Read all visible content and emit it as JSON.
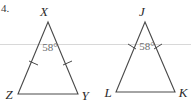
{
  "figure": {
    "problem_label": "4.",
    "background_color": "#ffffff",
    "line_color": "#4a4a4a",
    "angle_text_color": "#6d6d6d",
    "rule_color": "#d8d8d8",
    "width": 191,
    "height": 109
  },
  "triangles": [
    {
      "id": "triangle-xzy",
      "name": "Triangle XZY",
      "apex_label": "X",
      "bottom_left_label": "Z",
      "bottom_right_label": "Y",
      "angle_value": "58°",
      "angle_at": "X",
      "congruent_sides_ticks": 1,
      "apex": {
        "x": 48,
        "y": 22
      },
      "bottom_left": {
        "x": 18,
        "y": 94
      },
      "bottom_right": {
        "x": 78,
        "y": 94
      }
    },
    {
      "id": "triangle-jlk",
      "name": "Triangle JLK",
      "apex_label": "J",
      "bottom_left_label": "L",
      "bottom_right_label": "K",
      "angle_value": "58°",
      "angle_at": "J",
      "congruent_sides_ticks": 1,
      "apex": {
        "x": 145,
        "y": 22
      },
      "bottom_left": {
        "x": 116,
        "y": 92
      },
      "bottom_right": {
        "x": 175,
        "y": 92
      }
    }
  ],
  "rule": {
    "name": "horizontal-rule",
    "y": 44
  }
}
